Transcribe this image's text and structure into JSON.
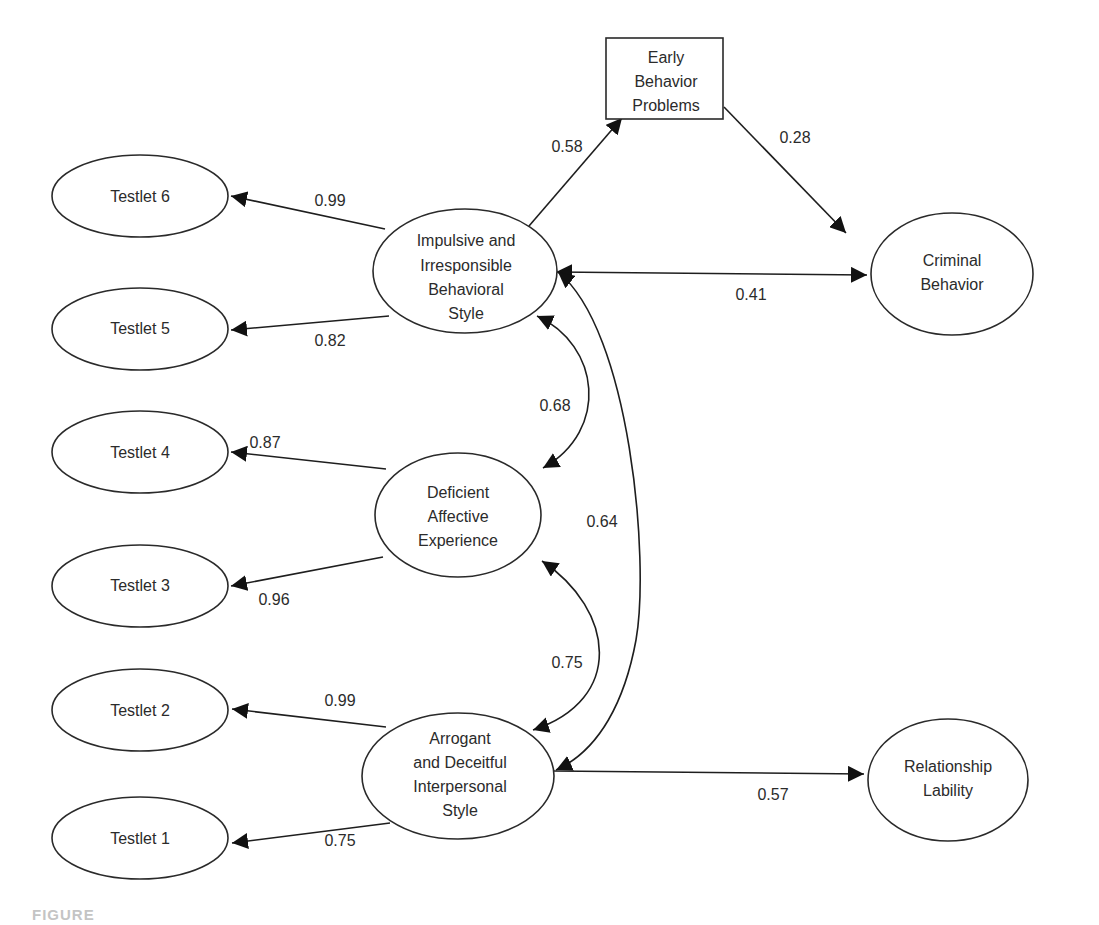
{
  "diagram": {
    "type": "structural-equation-model",
    "nodes": {
      "testlet6": {
        "label": [
          "Testlet 6"
        ],
        "shape": "ellipse"
      },
      "testlet5": {
        "label": [
          "Testlet 5"
        ],
        "shape": "ellipse"
      },
      "testlet4": {
        "label": [
          "Testlet 4"
        ],
        "shape": "ellipse"
      },
      "testlet3": {
        "label": [
          "Testlet 3"
        ],
        "shape": "ellipse"
      },
      "testlet2": {
        "label": [
          "Testlet 2"
        ],
        "shape": "ellipse"
      },
      "testlet1": {
        "label": [
          "Testlet 1"
        ],
        "shape": "ellipse"
      },
      "impulsive": {
        "label": [
          "Impulsive and",
          "Irresponsible",
          "Behavioral",
          "Style"
        ],
        "shape": "ellipse"
      },
      "deficient": {
        "label": [
          "Deficient",
          "Affective",
          "Experience"
        ],
        "shape": "ellipse"
      },
      "arrogant": {
        "label": [
          "Arrogant",
          "and Deceitful",
          "Interpersonal",
          "Style"
        ],
        "shape": "ellipse"
      },
      "early": {
        "label": [
          "Early",
          "Behavior",
          "Problems"
        ],
        "shape": "rectangle"
      },
      "criminal": {
        "label": [
          "Criminal",
          "Behavior"
        ],
        "shape": "ellipse"
      },
      "relationship": {
        "label": [
          "Relationship",
          "Lability"
        ],
        "shape": "ellipse"
      }
    },
    "edges": [
      {
        "from": "impulsive",
        "to": "testlet6",
        "value": "0.99",
        "type": "directed"
      },
      {
        "from": "impulsive",
        "to": "testlet5",
        "value": "0.82",
        "type": "directed"
      },
      {
        "from": "deficient",
        "to": "testlet4",
        "value": "0.87",
        "type": "directed"
      },
      {
        "from": "deficient",
        "to": "testlet3",
        "value": "0.96",
        "type": "directed"
      },
      {
        "from": "arrogant",
        "to": "testlet2",
        "value": "0.99",
        "type": "directed"
      },
      {
        "from": "arrogant",
        "to": "testlet1",
        "value": "0.75",
        "type": "directed"
      },
      {
        "from": "impulsive",
        "to": "early",
        "value": "0.58",
        "type": "directed"
      },
      {
        "from": "early",
        "to": "criminal",
        "value": "0.28",
        "type": "directed"
      },
      {
        "from": "impulsive",
        "to": "criminal",
        "value": "0.41",
        "type": "bidirectional"
      },
      {
        "from": "impulsive",
        "to": "deficient",
        "value": "0.68",
        "type": "bidirectional"
      },
      {
        "from": "impulsive",
        "to": "arrogant",
        "value": "0.64",
        "type": "bidirectional"
      },
      {
        "from": "deficient",
        "to": "arrogant",
        "value": "0.75",
        "type": "bidirectional"
      },
      {
        "from": "arrogant",
        "to": "relationship",
        "value": "0.57",
        "type": "directed"
      }
    ]
  },
  "labels": {
    "t6": "Testlet 6",
    "t5": "Testlet 5",
    "t4": "Testlet 4",
    "t3": "Testlet 3",
    "t2": "Testlet 2",
    "t1": "Testlet 1",
    "imp1": "Impulsive and",
    "imp2": "Irresponsible",
    "imp3": "Behavioral",
    "imp4": "Style",
    "def1": "Deficient",
    "def2": "Affective",
    "def3": "Experience",
    "arr1": "Arrogant",
    "arr2": "and Deceitful",
    "arr3": "Interpersonal",
    "arr4": "Style",
    "early1": "Early",
    "early2": "Behavior",
    "early3": "Problems",
    "crim1": "Criminal",
    "crim2": "Behavior",
    "rel1": "Relationship",
    "rel2": "Lability"
  },
  "coefficients": {
    "imp_t6": "0.99",
    "imp_t5": "0.82",
    "def_t4": "0.87",
    "def_t3": "0.96",
    "arr_t2": "0.99",
    "arr_t1": "0.75",
    "imp_early": "0.58",
    "early_crim": "0.28",
    "imp_crim": "0.41",
    "imp_def": "0.68",
    "imp_arr": "0.64",
    "def_arr": "0.75",
    "arr_rel": "0.57"
  },
  "caption": "FIGURE"
}
